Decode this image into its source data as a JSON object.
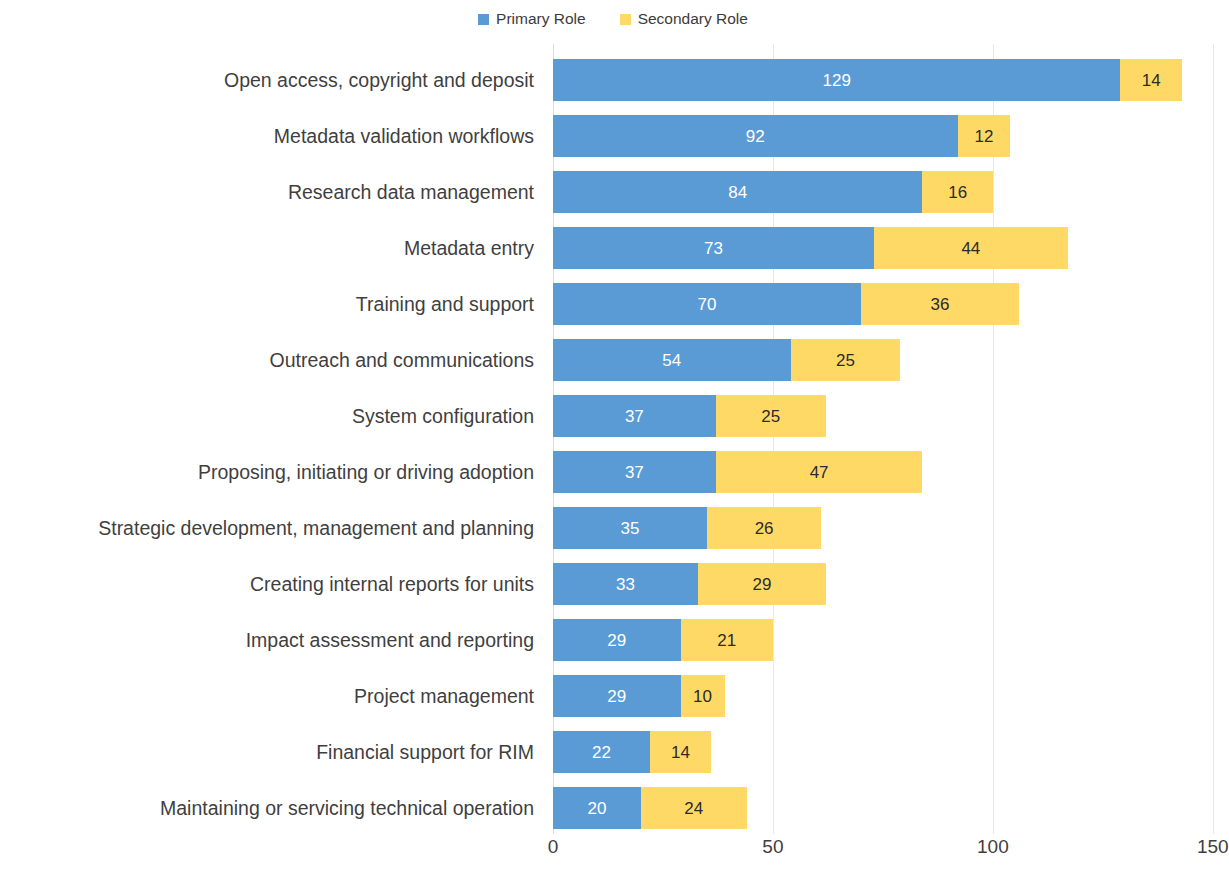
{
  "legend": {
    "items": [
      {
        "label": "Primary Role",
        "color": "#5b9bd5"
      },
      {
        "label": "Secondary Role",
        "color": "#ffd966"
      }
    ]
  },
  "axis": {
    "ticks": [
      "0",
      "50",
      "100",
      "150"
    ]
  },
  "colors": {
    "primary": "#5b9bd5",
    "secondary": "#ffd966",
    "primary_label": "#ffffff",
    "secondary_label": "#2b2b2b",
    "gridline": "#e8e8e8",
    "text": "#3f3f3f",
    "background": "#ffffff"
  },
  "chart_data": {
    "type": "bar",
    "orientation": "horizontal",
    "stacked": true,
    "title": "",
    "xlabel": "",
    "ylabel": "",
    "xlim": [
      0,
      150
    ],
    "xticks": [
      0,
      50,
      100,
      150
    ],
    "grid": true,
    "legend_position": "top-center",
    "categories": [
      "Open access, copyright and deposit",
      "Metadata validation workflows",
      "Research data management",
      "Metadata entry",
      "Training and support",
      "Outreach and communications",
      "System configuration",
      "Proposing, initiating or driving adoption",
      "Strategic development, management and planning",
      "Creating internal reports for units",
      "Impact assessment and reporting",
      "Project management",
      "Financial support for RIM",
      "Maintaining or servicing technical operation"
    ],
    "series": [
      {
        "name": "Primary Role",
        "color": "#5b9bd5",
        "values": [
          129,
          92,
          84,
          73,
          70,
          54,
          37,
          37,
          35,
          33,
          29,
          29,
          22,
          20
        ]
      },
      {
        "name": "Secondary Role",
        "color": "#ffd966",
        "values": [
          14,
          12,
          16,
          44,
          36,
          25,
          25,
          47,
          26,
          29,
          21,
          10,
          14,
          24
        ]
      }
    ],
    "totals": [
      143,
      104,
      100,
      117,
      106,
      79,
      62,
      84,
      61,
      62,
      50,
      39,
      36,
      44
    ]
  }
}
